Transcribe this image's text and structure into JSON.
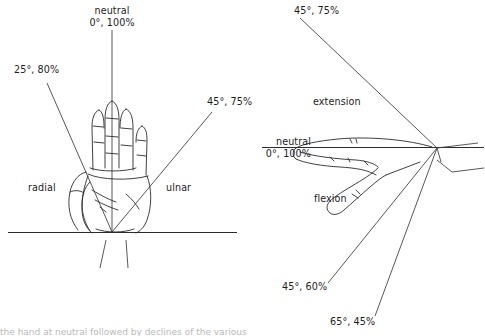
{
  "figure": {
    "background_color": "#ffffff",
    "line_color": "#2b2b2b",
    "text_color": "#1d1d1d"
  },
  "left_panel": {
    "name": "radial-ulnar-deviation-view",
    "view": "palmar (front) view of right hand",
    "labels": {
      "neutral": "neutral\n0°, 100%",
      "radial_deviation": "25°, 80%",
      "ulnar_deviation": "45°, 75%",
      "radial_side": "radial",
      "ulnar_side": "ulnar"
    }
  },
  "right_panel": {
    "name": "flexion-extension-view",
    "view": "lateral (side) view of hand",
    "labels": {
      "extension_value": "45°, 75%",
      "extension_name": "extension",
      "neutral": "neutral\n0°, 100%",
      "flexion_name": "flexion",
      "flexion_value_1": "45°, 60%",
      "flexion_value_2": "65°, 45%"
    }
  },
  "measurements": {
    "type": "angle-percent pairs",
    "entries": [
      {
        "motion": "neutral (radial/ulnar)",
        "angle_deg": 0,
        "percent": 100,
        "panel": "left"
      },
      {
        "motion": "radial deviation",
        "angle_deg": 25,
        "percent": 80,
        "panel": "left"
      },
      {
        "motion": "ulnar deviation",
        "angle_deg": 45,
        "percent": 75,
        "panel": "left"
      },
      {
        "motion": "extension",
        "angle_deg": 45,
        "percent": 75,
        "panel": "right"
      },
      {
        "motion": "neutral (flex/ext)",
        "angle_deg": 0,
        "percent": 100,
        "panel": "right"
      },
      {
        "motion": "flexion",
        "angle_deg": 45,
        "percent": 60,
        "panel": "right"
      },
      {
        "motion": "flexion",
        "angle_deg": 65,
        "percent": 45,
        "panel": "right"
      }
    ]
  },
  "caption": {
    "text": "the hand at neutral followed by declines of the various"
  }
}
